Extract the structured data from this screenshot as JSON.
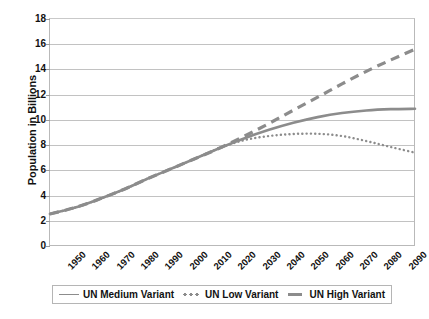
{
  "chart_data": {
    "type": "line",
    "title": "",
    "xlabel": "",
    "ylabel": "Population in Billions",
    "xlim": [
      1950,
      2100
    ],
    "ylim": [
      0,
      18
    ],
    "y_ticks": [
      0,
      2,
      4,
      6,
      8,
      10,
      12,
      14,
      16,
      18
    ],
    "grid": true,
    "legend_position": "bottom",
    "x": [
      1950,
      1960,
      1970,
      1980,
      1990,
      2000,
      2010,
      2020,
      2030,
      2040,
      2050,
      2060,
      2070,
      2080,
      2090,
      2100
    ],
    "categories": [
      "1950",
      "1960",
      "1970",
      "1980",
      "1990",
      "2000",
      "2010",
      "2020",
      "2030",
      "2040",
      "2050",
      "2060",
      "2070",
      "2080",
      "2090",
      "2100"
    ],
    "series": [
      {
        "name": "UN Medium Variant",
        "style": "solid",
        "color": "#8c8c8c",
        "values": [
          2.54,
          3.03,
          3.7,
          4.46,
          5.33,
          6.14,
          6.96,
          7.79,
          8.55,
          9.21,
          9.77,
          10.22,
          10.55,
          10.75,
          10.85,
          10.88
        ]
      },
      {
        "name": "UN Low Variant",
        "style": "dotted",
        "color": "#8c8c8c",
        "values": [
          2.54,
          3.03,
          3.7,
          4.46,
          5.33,
          6.14,
          6.96,
          7.79,
          8.4,
          8.72,
          8.88,
          8.9,
          8.72,
          8.32,
          7.85,
          7.4
        ]
      },
      {
        "name": "UN High Variant",
        "style": "dashed",
        "color": "#8c8c8c",
        "values": [
          2.54,
          3.03,
          3.7,
          4.46,
          5.33,
          6.14,
          6.96,
          7.79,
          8.72,
          9.72,
          10.77,
          11.8,
          12.85,
          13.85,
          14.75,
          15.6
        ]
      }
    ]
  },
  "axes": {
    "y_title": "Population in Billions",
    "y_ticks": [
      "18",
      "16",
      "14",
      "12",
      "10",
      "8",
      "6",
      "4",
      "2",
      "0"
    ],
    "x_ticks": [
      "1950",
      "1960",
      "1970",
      "1980",
      "1990",
      "2000",
      "2010",
      "2020",
      "2030",
      "2040",
      "2050",
      "2060",
      "2070",
      "2080",
      "2090",
      "2100"
    ]
  },
  "legend": {
    "entries": [
      {
        "label": "UN Medium Variant",
        "marker": "solid-line-swatch"
      },
      {
        "label": "UN Low Variant",
        "marker": "dotted-line-swatch"
      },
      {
        "label": "UN High Variant",
        "marker": "thick-line-swatch"
      }
    ]
  },
  "colors": {
    "series_gray": "#8c8c8c",
    "gridline": "#c2c2c2",
    "axis_border": "#b9b9b9",
    "text": "#111111",
    "background": "#ffffff"
  }
}
